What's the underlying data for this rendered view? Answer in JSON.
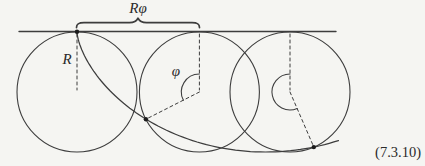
{
  "figure": {
    "labels": {
      "arc_length": "Rφ",
      "radius": "R",
      "angle": "φ",
      "equation_number": "(7.3.10)"
    },
    "colors": {
      "background": "#f5f5f2",
      "line": "#3d3d3d",
      "dot": "#1c1c1c"
    },
    "geometry_values": {
      "circle_count": 3,
      "traced_point_count": 3
    }
  }
}
